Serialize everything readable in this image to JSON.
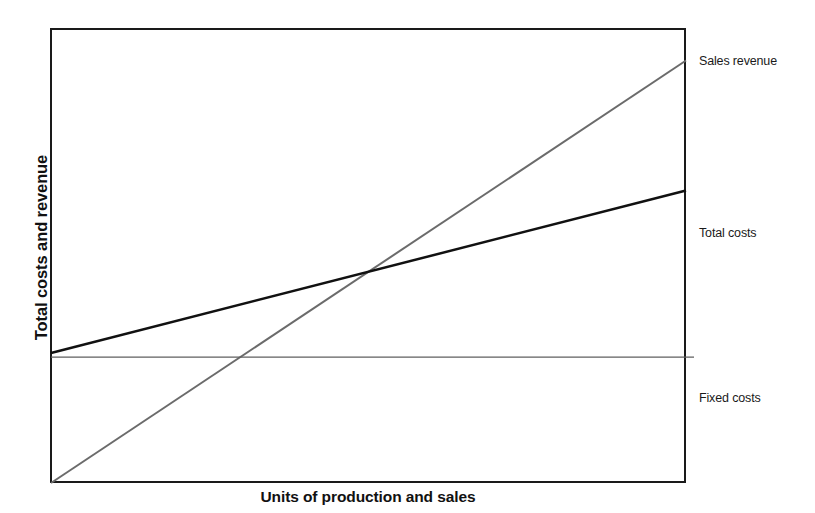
{
  "chart_data": {
    "type": "line",
    "title": "",
    "xlabel": "Units of production and sales",
    "ylabel": "Total costs and revenue",
    "xlim": [
      0,
      100
    ],
    "ylim": [
      -12,
      100
    ],
    "grid": false,
    "legend_position": "right-of-plot-line-ends",
    "axis_ticks": false,
    "axis_tick_labels": [],
    "series": [
      {
        "name": "Sales revenue",
        "color": "#6b6b6b",
        "linewidth": 2,
        "x": [
          0,
          100
        ],
        "values": [
          -12,
          92
        ]
      },
      {
        "name": "Total costs",
        "color": "#111111",
        "linewidth": 2.5,
        "x": [
          0,
          100
        ],
        "values": [
          20,
          60
        ]
      },
      {
        "name": "Fixed costs",
        "color": "#5f5f5f",
        "linewidth": 1.4,
        "x": [
          0,
          100
        ],
        "values": [
          19,
          19
        ]
      }
    ],
    "annotations": [
      {
        "name": "break-even-point",
        "x": 35,
        "y": 34,
        "label": ""
      }
    ]
  },
  "axes": {
    "y_title": "Total costs and revenue",
    "x_title": "Units of production and sales"
  },
  "labels": {
    "sales_revenue": "Sales revenue",
    "total_costs": "Total costs",
    "fixed_costs": "Fixed costs"
  },
  "colors": {
    "frame": "#1a1a1a",
    "background": "#ffffff",
    "sales_revenue_line": "#6b6b6b",
    "total_costs_line": "#111111",
    "fixed_costs_line": "#5f5f5f",
    "text": "#111111"
  }
}
